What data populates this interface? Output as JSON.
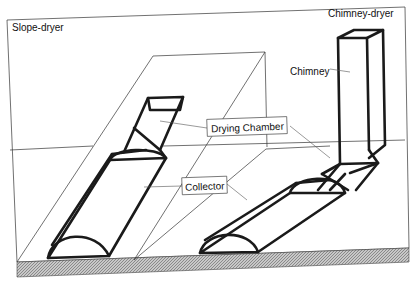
{
  "diagram": {
    "titles": {
      "left": "Slope-dryer",
      "right": "Chimney-dryer"
    },
    "labels": {
      "drying_chamber": "Drying Chamber",
      "collector": "Collector",
      "chimney": "Chimney"
    },
    "colors": {
      "line": "#1a1a1a",
      "ground_hatch": "#9a9a9a",
      "background": "#ffffff"
    }
  }
}
